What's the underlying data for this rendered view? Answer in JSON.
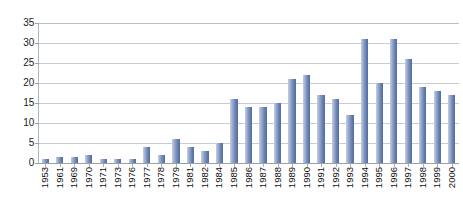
{
  "chart_data": {
    "type": "bar",
    "title": "",
    "subtitle": "",
    "xlabel": "",
    "ylabel": "",
    "categories": [
      "1953",
      "1961",
      "1969",
      "1970",
      "1971",
      "1973",
      "1976",
      "1977",
      "1978",
      "1979",
      "1981",
      "1982",
      "1984",
      "1985",
      "1986",
      "1987",
      "1988",
      "1989",
      "1990",
      "1991",
      "1992",
      "1993",
      "1994",
      "1995",
      "1996",
      "1997",
      "1998",
      "1999",
      "2000"
    ],
    "values": [
      1,
      1.5,
      1.5,
      2,
      1,
      1,
      1,
      4,
      2,
      6,
      4,
      3,
      5,
      16,
      14,
      14,
      15,
      21,
      22,
      17,
      16,
      12,
      31,
      20,
      31,
      26,
      19,
      18,
      17
    ],
    "series": [
      {
        "name": "Count",
        "values": [
          1,
          1.5,
          1.5,
          2,
          1,
          1,
          1,
          4,
          2,
          6,
          4,
          3,
          5,
          16,
          14,
          14,
          15,
          21,
          22,
          17,
          16,
          12,
          31,
          20,
          31,
          26,
          19,
          18,
          17
        ]
      }
    ],
    "ylim": [
      0,
      35
    ],
    "y_ticks": [
      0,
      5,
      10,
      15,
      20,
      25,
      30,
      35
    ],
    "y_tick_labels": [
      "0",
      "5",
      "10",
      "15",
      "20",
      "25",
      "30",
      "35"
    ],
    "grid": true,
    "grid_axis": "y",
    "legend": false,
    "legend_position": "none",
    "x_tick_rotation": 90,
    "bar_color": "#6d85b5",
    "bar_color_light": "#c5cde0",
    "bar_color_dark": "#536da2",
    "gridline_color": "#c8cdd4",
    "axis_color": "#9aa1a9",
    "background": "#ffffff"
  }
}
